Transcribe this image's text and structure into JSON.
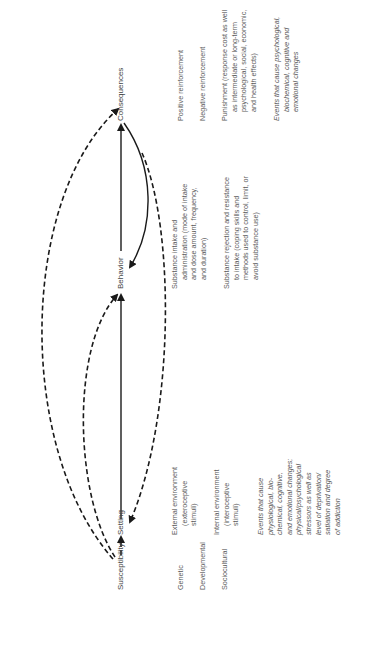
{
  "nodes": {
    "susceptibility": "Susceptibility",
    "setting": "Setting",
    "behavior": "Behavior",
    "consequences": "Consequences"
  },
  "susceptibility_factors": [
    "Genetic",
    "Developmental",
    "Sociocultural"
  ],
  "setting_items": {
    "external": [
      "External environment",
      "(exteroceptive",
      "stimuli)"
    ],
    "internal": [
      "Internal environment",
      "(interoceptive",
      "stimuli)"
    ],
    "events": [
      "Events that cause",
      "physiological, bio-",
      "chemical, cognitive,",
      "and emotional changes;",
      "physical/psychological",
      "stressors as well as",
      "level of deprivation/",
      "satiation and degree",
      "of addiction"
    ]
  },
  "behavior_items": {
    "intake": [
      "Substance intake and",
      "administration (mode of intake",
      "and dose amount, frequency,",
      "and duration)"
    ],
    "rejection": [
      "Substance rejection and resistance",
      "to intake (coping skills and",
      "methods used to control, limit, or",
      "avoid substance use)"
    ]
  },
  "consequence_items": {
    "positive": "Positive reinforcement",
    "negative": "Negative reinforcement",
    "punishment": [
      "Punishment (response cost as well",
      "as intermediate or long-term",
      "psychological, social, economic,",
      "and health effects)"
    ],
    "events": [
      "Events that cause psychological,",
      "biochemical, cognitive and",
      "emotional changes"
    ]
  },
  "colors": {
    "arrow": "#1a1a1a",
    "text": "#5a5a5a"
  }
}
